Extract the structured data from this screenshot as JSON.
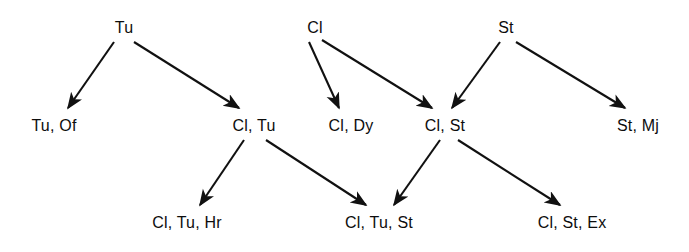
{
  "diagram": {
    "type": "directed-acyclic-graph",
    "background_color": "#ffffff",
    "node_text_color": "#0d0d0d",
    "edge_color": "#111111",
    "levels": [
      {
        "index": 0,
        "nodes": [
          {
            "id": "tu",
            "label": "Tu",
            "x": 124,
            "y": 20
          },
          {
            "id": "cl",
            "label": "Cl",
            "x": 315,
            "y": 20
          },
          {
            "id": "st",
            "label": "St",
            "x": 506,
            "y": 20
          }
        ]
      },
      {
        "index": 1,
        "nodes": [
          {
            "id": "tu_of",
            "label": "Tu, Of",
            "x": 54,
            "y": 118
          },
          {
            "id": "cl_tu",
            "label": "Cl, Tu",
            "x": 254,
            "y": 118
          },
          {
            "id": "cl_dy",
            "label": "Cl, Dy",
            "x": 351,
            "y": 118
          },
          {
            "id": "cl_st",
            "label": "Cl, St",
            "x": 445,
            "y": 118
          },
          {
            "id": "st_mj",
            "label": "St, Mj",
            "x": 638,
            "y": 118
          }
        ]
      },
      {
        "index": 2,
        "nodes": [
          {
            "id": "cl_tu_hr",
            "label": "Cl, Tu, Hr",
            "x": 187,
            "y": 215
          },
          {
            "id": "cl_tu_st",
            "label": "Cl, Tu, St",
            "x": 379,
            "y": 215
          },
          {
            "id": "cl_st_ex",
            "label": "Cl, St, Ex",
            "x": 572,
            "y": 215
          }
        ]
      }
    ],
    "edges": [
      {
        "id": "e1",
        "from": "tu",
        "to": "tu_of",
        "x1": 114,
        "y1": 42,
        "x2": 68,
        "y2": 108
      },
      {
        "id": "e2",
        "from": "tu",
        "to": "cl_tu",
        "x1": 134,
        "y1": 42,
        "x2": 239,
        "y2": 108
      },
      {
        "id": "e3",
        "from": "cl",
        "to": "cl_dy",
        "x1": 309,
        "y1": 42,
        "x2": 339,
        "y2": 108
      },
      {
        "id": "e4",
        "from": "cl",
        "to": "cl_st",
        "x1": 322,
        "y1": 40,
        "x2": 432,
        "y2": 108
      },
      {
        "id": "e5",
        "from": "st",
        "to": "cl_st",
        "x1": 500,
        "y1": 42,
        "x2": 452,
        "y2": 108
      },
      {
        "id": "e6",
        "from": "st",
        "to": "st_mj",
        "x1": 516,
        "y1": 42,
        "x2": 625,
        "y2": 108
      },
      {
        "id": "e7",
        "from": "cl_tu",
        "to": "cl_tu_hr",
        "x1": 244,
        "y1": 140,
        "x2": 200,
        "y2": 205
      },
      {
        "id": "e8",
        "from": "cl_tu",
        "to": "cl_tu_st",
        "x1": 266,
        "y1": 140,
        "x2": 366,
        "y2": 205
      },
      {
        "id": "e9",
        "from": "cl_st",
        "to": "cl_tu_st",
        "x1": 440,
        "y1": 140,
        "x2": 394,
        "y2": 205
      },
      {
        "id": "e10",
        "from": "cl_st",
        "to": "cl_st_ex",
        "x1": 458,
        "y1": 140,
        "x2": 560,
        "y2": 205
      }
    ]
  }
}
